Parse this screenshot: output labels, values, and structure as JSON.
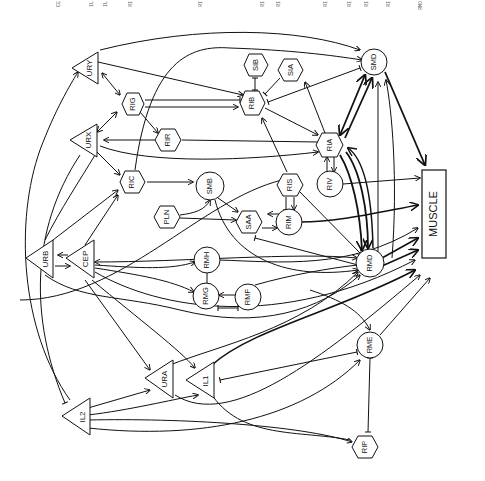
{
  "diagram": {
    "header_fragments": [
      "CE",
      "IL",
      "IL",
      "RI",
      "RI",
      "RI",
      "RI",
      "RI",
      "RI",
      "RI",
      "RI",
      "RMD"
    ],
    "muscle_label": "MUSCLE",
    "nodes": [
      {
        "id": "URY",
        "shape": "triangle",
        "x": 85,
        "y": 68
      },
      {
        "id": "URX",
        "shape": "triangle",
        "x": 85,
        "y": 140
      },
      {
        "id": "URB",
        "shape": "triangle",
        "x": 45,
        "y": 262
      },
      {
        "id": "CEP",
        "shape": "triangle",
        "x": 82,
        "y": 262
      },
      {
        "id": "URA",
        "shape": "triangle",
        "x": 165,
        "y": 380
      },
      {
        "id": "IL1",
        "shape": "triangle",
        "x": 207,
        "y": 380
      },
      {
        "id": "IL2",
        "shape": "triangle",
        "x": 75,
        "y": 415
      },
      {
        "id": "RIG",
        "shape": "hexagon",
        "x": 132,
        "y": 104
      },
      {
        "id": "RIR",
        "shape": "hexagon",
        "x": 170,
        "y": 140
      },
      {
        "id": "RIC",
        "shape": "hexagon",
        "x": 133,
        "y": 182
      },
      {
        "id": "PLN",
        "shape": "hexagon",
        "x": 168,
        "y": 217
      },
      {
        "id": "SIB",
        "shape": "hexagon",
        "x": 257,
        "y": 65
      },
      {
        "id": "RIB",
        "shape": "hexagon",
        "x": 253,
        "y": 103
      },
      {
        "id": "SIA",
        "shape": "hexagon",
        "x": 292,
        "y": 70
      },
      {
        "id": "RIA",
        "shape": "hexagon",
        "x": 331,
        "y": 145
      },
      {
        "id": "RIS",
        "shape": "hexagon",
        "x": 291,
        "y": 185
      },
      {
        "id": "SAA",
        "shape": "hexagon",
        "x": 250,
        "y": 222
      },
      {
        "id": "RIP",
        "shape": "hexagon",
        "x": 365,
        "y": 447
      },
      {
        "id": "SMB",
        "shape": "circle",
        "x": 210,
        "y": 186
      },
      {
        "id": "SMD",
        "shape": "circle",
        "x": 375,
        "y": 62
      },
      {
        "id": "RIV",
        "shape": "circle",
        "x": 330,
        "y": 184
      },
      {
        "id": "RIM",
        "shape": "circle",
        "x": 289,
        "y": 222
      },
      {
        "id": "RMH",
        "shape": "circle",
        "x": 207,
        "y": 260
      },
      {
        "id": "RMG",
        "shape": "circle",
        "x": 206,
        "y": 295
      },
      {
        "id": "RMF",
        "shape": "circle",
        "x": 248,
        "y": 296
      },
      {
        "id": "RMD",
        "shape": "circle",
        "x": 370,
        "y": 262
      },
      {
        "id": "RME",
        "shape": "circle",
        "x": 370,
        "y": 345
      }
    ],
    "legend": {
      "triangle": "sensory neuron",
      "hexagon": "interneuron",
      "circle": "motor neuron",
      "arrow": "excitatory / chemical synapse",
      "bar": "inhibitory / gap junction"
    },
    "colors": {
      "line": "#111111",
      "background": "#ffffff"
    }
  }
}
